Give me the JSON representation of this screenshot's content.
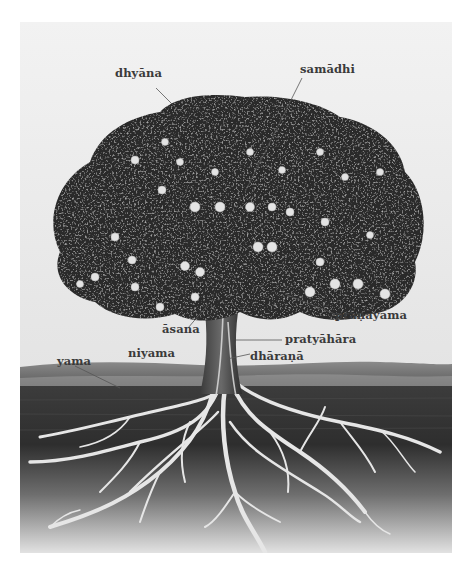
{
  "figure": {
    "labels": [
      {
        "id": "dhyana",
        "text": "dhyāna"
      },
      {
        "id": "samadhi",
        "text": "samādhi"
      },
      {
        "id": "pranayama",
        "text": "prāṇāyāma"
      },
      {
        "id": "asana",
        "text": "āsana"
      },
      {
        "id": "pratyahara",
        "text": "pratyāhāra"
      },
      {
        "id": "niyama",
        "text": "niyama"
      },
      {
        "id": "dharana",
        "text": "dhāraṇā"
      },
      {
        "id": "yama",
        "text": "yama"
      }
    ],
    "colors": {
      "sky": "#eeeeee",
      "foliage": "#2b2b2b",
      "fruit": "#e6e6e6",
      "trunk": "#4a4a4a",
      "soil_top": "#3a3a3a",
      "soil_bottom": "#d8d8d8",
      "roots": "#e8e8e8",
      "label_text": "#3a3a3a"
    }
  }
}
